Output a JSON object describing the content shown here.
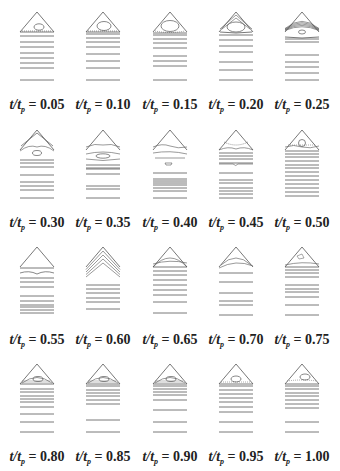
{
  "figure": {
    "variable_label": "t/t",
    "subscript": "p",
    "panels": [
      {
        "value": "0.05",
        "label_text": "t/tp = 0.05",
        "lines": [
          36,
          42,
          47,
          53,
          58,
          63,
          68,
          80
        ],
        "contours": "small-ellipse"
      },
      {
        "value": "0.10",
        "label_text": "t/tp = 0.10",
        "lines": [
          34,
          38,
          42,
          47,
          54,
          61,
          68,
          80
        ],
        "contours": "ellipse"
      },
      {
        "value": "0.15",
        "label_text": "t/tp = 0.15",
        "lines": [
          35,
          39,
          43,
          48,
          56,
          61,
          66,
          80
        ],
        "contours": "large-ellipse"
      },
      {
        "value": "0.20",
        "label_text": "t/tp = 0.20",
        "lines": [
          35,
          40,
          46,
          52,
          62,
          70,
          80
        ],
        "contours": "nested-arcs-ellipse"
      },
      {
        "value": "0.25",
        "label_text": "t/tp = 0.25",
        "lines": [
          42,
          55,
          62,
          67,
          73,
          80
        ],
        "contours": "many-arcs-small-ellipse"
      },
      {
        "value": "0.30",
        "label_text": "t/tp = 0.30",
        "lines": [
          42,
          45,
          49,
          57,
          64,
          68,
          72,
          80
        ],
        "contours": "arcs-detached-ellipse"
      },
      {
        "value": "0.35",
        "label_text": "t/tp = 0.35",
        "lines": [
          47,
          50,
          51,
          56,
          68,
          71,
          80
        ],
        "contours": "arcs-flat-ellipse"
      },
      {
        "value": "0.40",
        "label_text": "t/tp = 0.40",
        "lines": [
          55,
          61,
          63,
          65,
          67,
          70,
          73,
          80
        ],
        "contours": "wavy-small-cell"
      },
      {
        "value": "0.45",
        "label_text": "t/tp = 0.45",
        "lines": [
          35,
          38,
          41,
          45,
          55,
          62,
          65,
          70,
          73,
          76,
          80
        ],
        "contours": "dotted-cell-kink"
      },
      {
        "value": "0.50",
        "label_text": "t/tp = 0.50",
        "lines": [
          33,
          36,
          39,
          43,
          47,
          50,
          54,
          58,
          62,
          66,
          70,
          74,
          78
        ],
        "contours": "small-circle"
      },
      {
        "value": "0.55",
        "label_text": "t/tp = 0.55",
        "lines": [
          33,
          43,
          47,
          52,
          61,
          66,
          70,
          72,
          75,
          78
        ],
        "contours": "empty-triangle-wave"
      },
      {
        "value": "0.60",
        "label_text": "t/tp = 0.60",
        "lines": [
          50,
          54,
          58,
          63,
          67,
          74
        ],
        "contours": "stacked-chevrons"
      },
      {
        "value": "0.65",
        "label_text": "t/tp = 0.65",
        "lines": [
          32,
          36,
          40,
          45,
          50,
          55,
          60,
          67,
          78
        ],
        "contours": "arcs-bulge"
      },
      {
        "value": "0.70",
        "label_text": "t/tp = 0.70",
        "lines": [
          38,
          47,
          58,
          66,
          70,
          80
        ],
        "contours": "arcs-top"
      },
      {
        "value": "0.75",
        "label_text": "t/tp = 0.75",
        "lines": [
          32,
          35,
          38,
          42,
          50,
          54,
          57,
          62,
          70,
          80
        ],
        "contours": "tiny-cell-arcs"
      },
      {
        "value": "0.80",
        "label_text": "t/tp = 0.80",
        "lines": [
          37,
          40,
          44,
          47,
          50,
          55,
          62,
          70,
          80
        ],
        "contours": "hatched-cell"
      },
      {
        "value": "0.85",
        "label_text": "t/tp = 0.85",
        "lines": [
          34,
          38,
          41,
          44,
          48,
          52,
          68,
          80
        ],
        "contours": "hatched-cell"
      },
      {
        "value": "0.90",
        "label_text": "t/tp = 0.90",
        "lines": [
          34,
          37,
          40,
          43,
          48,
          58,
          70,
          80
        ],
        "contours": "hatched-cell"
      },
      {
        "value": "0.95",
        "label_text": "t/tp = 0.95",
        "lines": [
          34,
          38,
          42,
          46,
          50,
          55,
          60,
          70,
          80
        ],
        "contours": "flat-cell"
      },
      {
        "value": "1.00",
        "label_text": "t/tp = 1.00",
        "lines": [
          34,
          37,
          41,
          44,
          48,
          52,
          56,
          70,
          80
        ],
        "contours": "ellipse-dotted"
      }
    ]
  },
  "colors": {
    "line": "#555555",
    "text": "#222222",
    "background": "#ffffff"
  }
}
